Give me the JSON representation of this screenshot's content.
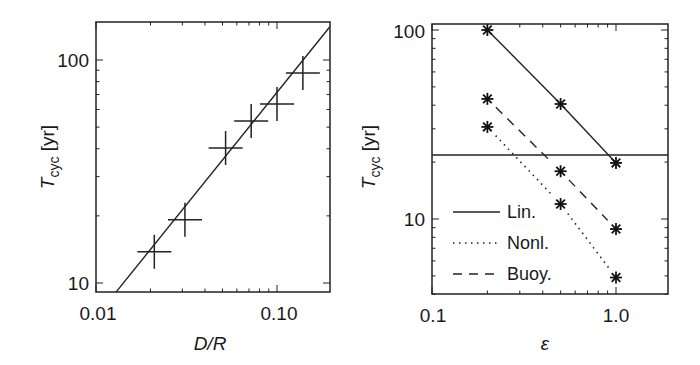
{
  "chart_data": [
    {
      "type": "scatter",
      "panel": "left",
      "title": "",
      "xlabel": "D/R",
      "ylabel": "T_cyc [yr]",
      "ylabel_parts": {
        "main": "T",
        "sub": "cyc",
        "unit": " [yr]"
      },
      "xscale": "log",
      "yscale": "log",
      "xlim": [
        0.01,
        0.2
      ],
      "ylim": [
        9.1,
        148
      ],
      "xticks": [
        {
          "value": 0.01,
          "label": "0.01"
        },
        {
          "value": 0.1,
          "label": "0.10"
        }
      ],
      "yticks": [
        {
          "value": 10,
          "label": "10"
        },
        {
          "value": 100,
          "label": "100"
        }
      ],
      "grid": false,
      "series": [
        {
          "name": "data",
          "marker": "cross-errorbar",
          "x": [
            0.021,
            0.031,
            0.052,
            0.072,
            0.1,
            0.139
          ],
          "y": [
            13.8,
            19.2,
            40.3,
            53.2,
            63.5,
            87.5
          ]
        },
        {
          "name": "fit",
          "style": "solid",
          "x": [
            0.0129,
            0.196
          ],
          "y": [
            9.1,
            141
          ]
        }
      ]
    },
    {
      "type": "line",
      "panel": "right",
      "title": "",
      "xlabel": "ε",
      "ylabel": "T_cyc [yr]",
      "ylabel_parts": {
        "main": "T",
        "sub": "cyc",
        "unit": " [yr]"
      },
      "xscale": "log",
      "yscale": "log",
      "xlim": [
        0.1,
        1.9
      ],
      "ylim": [
        4.0,
        107
      ],
      "xticks": [
        {
          "value": 0.1,
          "label": "0.1"
        },
        {
          "value": 1.0,
          "label": "1.0"
        }
      ],
      "yticks": [
        {
          "value": 10,
          "label": "10"
        },
        {
          "value": 100,
          "label": "100"
        }
      ],
      "grid": false,
      "legend_position": "lower left",
      "x": [
        0.2,
        0.5,
        1.0
      ],
      "series": [
        {
          "name": "Lin.",
          "style": "solid",
          "marker": "asterisk",
          "values": [
            100,
            40.6,
            19.8
          ]
        },
        {
          "name": "Nonl.",
          "style": "dotted",
          "marker": "asterisk",
          "values": [
            30.7,
            12.0,
            4.9
          ]
        },
        {
          "name": "Buoy.",
          "style": "dashed",
          "marker": "asterisk",
          "values": [
            43.2,
            17.9,
            8.85
          ]
        }
      ],
      "annotations": [
        {
          "type": "hline",
          "y": 21.8,
          "style": "solid"
        }
      ]
    }
  ]
}
